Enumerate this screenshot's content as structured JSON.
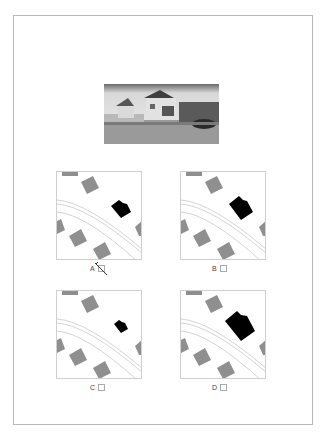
{
  "photo": {
    "alt": "street-view-photo-of-house"
  },
  "options": [
    {
      "label": "A",
      "checked": true,
      "building_scale": 1.0
    },
    {
      "label": "B",
      "checked": false,
      "building_scale": 1.25
    },
    {
      "label": "C",
      "checked": false,
      "building_scale": 0.7
    },
    {
      "label": "D",
      "checked": false,
      "building_scale": 1.5
    }
  ],
  "colors": {
    "building_gray": "#8f8f8f",
    "target_building": "#000000",
    "road_line": "#c8c8c8",
    "border": "#b8b8b8"
  }
}
